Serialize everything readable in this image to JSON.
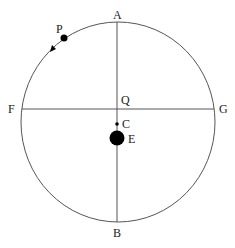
{
  "diagram": {
    "type": "circular-orbit",
    "colors": {
      "stroke": "#555555",
      "fill": "#000000",
      "text": "#222222"
    },
    "circle": {
      "cx": 117,
      "cy": 112,
      "r": 98
    },
    "labels": {
      "A": "A",
      "B": "B",
      "F": "F",
      "G": "G",
      "Q": "Q",
      "C": "C",
      "E": "E",
      "P": "P"
    },
    "points": {
      "P": {
        "x": 64,
        "y": 38,
        "description": "orbiting body"
      },
      "C": {
        "x": 117,
        "y": 124,
        "description": "small point"
      },
      "E": {
        "x": 117,
        "y": 138,
        "description": "large body"
      }
    },
    "arrow": {
      "direction": "counterclockwise",
      "x": 53,
      "y": 48
    }
  }
}
